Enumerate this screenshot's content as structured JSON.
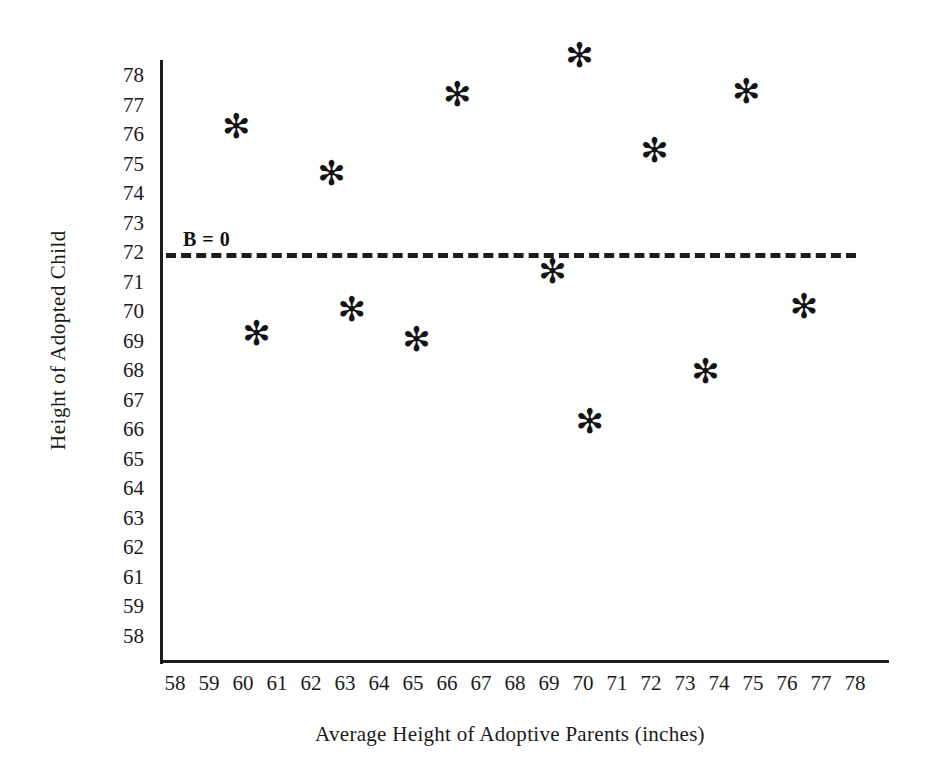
{
  "chart_data": {
    "type": "scatter",
    "title": "",
    "xlabel": "Average Height of Adoptive Parents (inches)",
    "ylabel": "Height  of  Adopted Child",
    "xlim": [
      58,
      78
    ],
    "ylim": [
      58,
      78
    ],
    "grid": false,
    "legend": null,
    "marker": "asterisk",
    "marker_color": "#141414",
    "x_tick_labels": [
      "58",
      "59",
      "60",
      "61",
      "62",
      "63",
      "64",
      "65",
      "66",
      "67",
      "68",
      "69",
      "70",
      "71",
      "72",
      "73",
      "74",
      "75",
      "76",
      "77",
      "78"
    ],
    "y_tick_labels": [
      "78",
      "77",
      "76",
      "75",
      "74",
      "73",
      "72",
      "71",
      "70",
      "69",
      "68",
      "67",
      "66",
      "65",
      "64",
      "63",
      "62",
      "61",
      "59",
      "58"
    ],
    "x": [
      59.8,
      62.6,
      66.3,
      69.9,
      74.8,
      72.1,
      69.1,
      76.5,
      60.4,
      63.2,
      65.1,
      73.6,
      70.2
    ],
    "y": [
      76.3,
      74.7,
      77.4,
      78.7,
      77.5,
      75.5,
      71.4,
      70.2,
      69.3,
      70.1,
      69.1,
      68.0,
      66.3
    ],
    "points": [
      {
        "x": 59.8,
        "y": 76.3
      },
      {
        "x": 62.6,
        "y": 74.7
      },
      {
        "x": 66.3,
        "y": 77.4
      },
      {
        "x": 69.9,
        "y": 78.7
      },
      {
        "x": 74.8,
        "y": 77.5
      },
      {
        "x": 72.1,
        "y": 75.5
      },
      {
        "x": 69.1,
        "y": 71.4
      },
      {
        "x": 76.5,
        "y": 70.2
      },
      {
        "x": 60.4,
        "y": 69.3
      },
      {
        "x": 63.2,
        "y": 70.1
      },
      {
        "x": 65.1,
        "y": 69.1
      },
      {
        "x": 73.6,
        "y": 68.0
      },
      {
        "x": 70.2,
        "y": 66.3
      }
    ],
    "annotations": [
      {
        "text": "B = 0",
        "type": "reference-line-label",
        "y": 72
      }
    ],
    "reference_line": {
      "label": "B = 0",
      "y": 72,
      "style": "dashed",
      "color": "#1c1c1c"
    },
    "marker_glyph": "✻"
  },
  "axes": {
    "y_title": "Height  of  Adopted Child",
    "x_title": "Average Height of Adoptive Parents (inches)"
  }
}
